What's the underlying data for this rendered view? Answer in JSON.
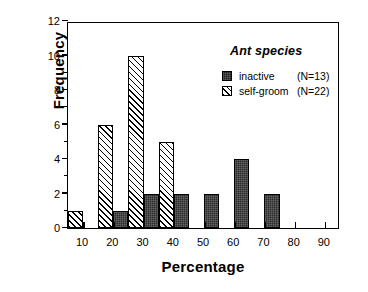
{
  "chart_data": {
    "type": "bar",
    "title": "",
    "xlabel": "Percentage",
    "ylabel": "Frequency",
    "xlim": [
      5,
      95
    ],
    "ylim": [
      0,
      12
    ],
    "ytick_values": [
      0,
      2,
      4,
      6,
      8,
      10,
      12
    ],
    "ytick_labels": [
      "0",
      "2",
      "4",
      "6",
      "8",
      "10",
      "12"
    ],
    "yminor_values": [
      1,
      3,
      5,
      7,
      9,
      11
    ],
    "xtick_values": [
      10,
      20,
      30,
      40,
      50,
      60,
      70,
      80,
      90
    ],
    "xtick_labels": [
      "10",
      "20",
      "30",
      "40",
      "50",
      "60",
      "70",
      "80",
      "90"
    ],
    "grid": false,
    "legend_position": "upper-right",
    "legend_title": "Ant species",
    "series": [
      {
        "name": "inactive",
        "count_label": "(N=13)",
        "n": 13,
        "fill": "solid",
        "color": "#1e1e1e",
        "bins": [
          {
            "x": 20,
            "value": 1
          },
          {
            "x": 30,
            "value": 2
          },
          {
            "x": 40,
            "value": 2
          },
          {
            "x": 50,
            "value": 2
          },
          {
            "x": 60,
            "value": 4
          },
          {
            "x": 70,
            "value": 2
          }
        ]
      },
      {
        "name": "self-groom",
        "count_label": "(N=22)",
        "n": 22,
        "fill": "hatched",
        "color": "#ffffff",
        "bins": [
          {
            "x": 10,
            "value": 1
          },
          {
            "x": 20,
            "value": 6
          },
          {
            "x": 30,
            "value": 10
          },
          {
            "x": 40,
            "value": 5
          }
        ]
      }
    ]
  },
  "legend": {
    "title": "Ant species",
    "rows": [
      {
        "label": "inactive",
        "count": "(N=13)"
      },
      {
        "label": "self-groom",
        "count": "(N=22)"
      }
    ]
  },
  "axes": {
    "ylabel": "Frequency",
    "xlabel": "Percentage"
  }
}
